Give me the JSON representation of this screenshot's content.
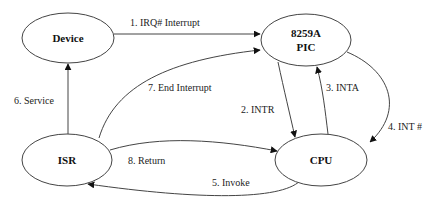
{
  "diagram": {
    "nodes": [
      {
        "id": "device",
        "label": "Device"
      },
      {
        "id": "pic",
        "label_line1": "8259A",
        "label_line2": "PIC"
      },
      {
        "id": "isr",
        "label": "ISR"
      },
      {
        "id": "cpu",
        "label": "CPU"
      }
    ],
    "edges": [
      {
        "from": "device",
        "to": "pic",
        "label": "1. IRQ# Interrupt"
      },
      {
        "from": "pic",
        "to": "cpu",
        "label": "2. INTR"
      },
      {
        "from": "cpu",
        "to": "pic",
        "label": "3. INTA"
      },
      {
        "from": "pic",
        "to": "cpu",
        "label": "4. INT #"
      },
      {
        "from": "cpu",
        "to": "isr",
        "label": "5. Invoke"
      },
      {
        "from": "isr",
        "to": "device",
        "label": "6. Service"
      },
      {
        "from": "isr",
        "to": "pic",
        "label": "7. End Interrupt"
      },
      {
        "from": "isr",
        "to": "cpu",
        "label": "8. Return"
      }
    ]
  }
}
